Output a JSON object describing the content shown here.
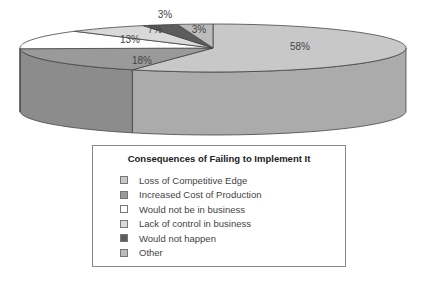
{
  "chart_data": {
    "type": "pie",
    "style": "3d",
    "title": "Consequences of Failing to Implement It",
    "categories": [
      "Loss of Competitive Edge",
      "Increased Cost of Production",
      "Would not be in business",
      "Lack of control in business",
      "Would not happen",
      "Other"
    ],
    "values": [
      58,
      18,
      13,
      7,
      3,
      3
    ],
    "labels": [
      "58%",
      "18%",
      "13%",
      "7%",
      "3%",
      "3%"
    ],
    "colors": [
      "#c8c8c8",
      "#9a9a9a",
      "#ffffff",
      "#d9d9d9",
      "#5c5c5c",
      "#bcbcbc"
    ],
    "side_colors": [
      "#ababab",
      "#8c8c8c",
      "#e8e8e8",
      "#c4c4c4",
      "#4a4a4a",
      "#a8a8a8"
    ],
    "legend_position": "bottom"
  },
  "legend": {
    "title": "Consequences of Failing to Implement It",
    "items": [
      {
        "label": "Loss of Competitive Edge",
        "color": "#c8c8c8"
      },
      {
        "label": "Increased Cost of Production",
        "color": "#9a9a9a"
      },
      {
        "label": "Would not be in business",
        "color": "#ffffff"
      },
      {
        "label": "Lack of control in business",
        "color": "#d9d9d9"
      },
      {
        "label": "Would not happen",
        "color": "#5c5c5c"
      },
      {
        "label": "Other",
        "color": "#bcbcbc"
      }
    ]
  }
}
